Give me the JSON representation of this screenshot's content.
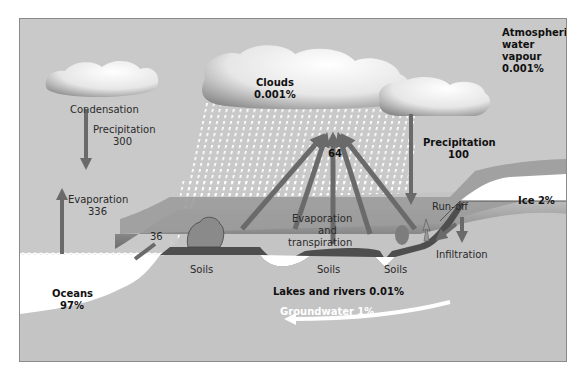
{
  "diagram": {
    "labels": {
      "condensation": "Condensation",
      "precip_left": "Precipitation",
      "precip_left_value": "300",
      "evap_left": "Evaporation",
      "evap_left_value": "336",
      "flow_36": "36",
      "clouds": "Clouds",
      "clouds_pct": "0.001%",
      "flow_64": "64",
      "atmo_1": "Atmospheric",
      "atmo_2": "water",
      "atmo_3": "vapour",
      "atmo_pct": "0.001%",
      "precip_right": "Precipitation",
      "precip_right_value": "100",
      "evap_trans_1": "Evaporation",
      "evap_trans_2": "and",
      "evap_trans_3": "transpiration",
      "runoff": "Run-off",
      "ice": "Ice 2%",
      "infiltration": "Infiltration",
      "soils_1": "Soils",
      "soils_2": "Soils",
      "soils_3": "Soils",
      "oceans": "Oceans",
      "oceans_pct": "97%",
      "lakes": "Lakes and rivers 0.01%",
      "groundwater": "Groundwater 1%"
    },
    "colors": {
      "sky": "#c9c9c9",
      "arrow": "#6a6a6a",
      "ground": "#8f8f8f",
      "soil": "#4e4e4e",
      "water": "#ffffff",
      "rock": "#c4c4c4"
    }
  }
}
